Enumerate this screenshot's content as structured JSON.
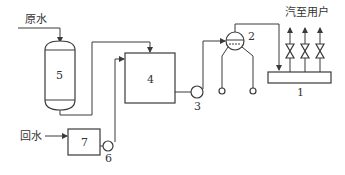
{
  "diagram": {
    "labels": {
      "raw_water": "原水",
      "return_water": "回水",
      "steam_to_users": "汽至用户"
    },
    "components": [
      {
        "id": "1",
        "label": "1"
      },
      {
        "id": "2",
        "label": "2"
      },
      {
        "id": "3",
        "label": "3"
      },
      {
        "id": "4",
        "label": "4"
      },
      {
        "id": "5",
        "label": "5"
      },
      {
        "id": "6",
        "label": "6"
      },
      {
        "id": "7",
        "label": "7"
      }
    ]
  }
}
